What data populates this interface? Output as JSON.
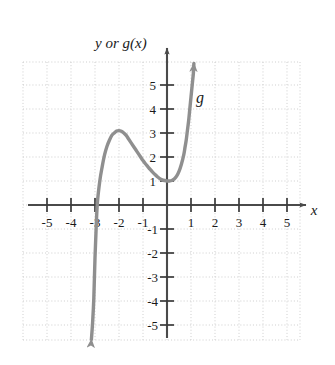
{
  "figure": {
    "y_axis_label": "y or g(x)",
    "x_axis_label": "x",
    "curve_label": "g"
  },
  "chart_data": {
    "type": "line",
    "title": "",
    "xlabel": "x",
    "ylabel": "y or g(x)",
    "xlim": [
      -5.9,
      5.6
    ],
    "ylim": [
      -5.9,
      6.0
    ],
    "grid": true,
    "legend": false,
    "x_ticks": [
      -5,
      -4,
      -3,
      -2,
      -1,
      1,
      2,
      3,
      4,
      5
    ],
    "y_ticks": [
      -5,
      -4,
      -3,
      -2,
      -1,
      1,
      2,
      3,
      4,
      5
    ],
    "x_tick_labels": [
      "-5",
      "-4",
      "-3",
      "-2",
      "-1",
      "1",
      "2",
      "3",
      "4",
      "5"
    ],
    "y_tick_labels": [
      "-5",
      "-4",
      "-3",
      "-2",
      "-1",
      "1",
      "2",
      "3",
      "4",
      "5"
    ],
    "series": [
      {
        "name": "g",
        "color": "#8f8f8f",
        "arrow_start": true,
        "arrow_end": true,
        "annotations": [
          {
            "text": "g",
            "x": 1.0,
            "y": 4.3
          }
        ],
        "features": {
          "local_maximum": [
            -2.0,
            3.1
          ],
          "local_minimum": [
            0.15,
            1.0
          ],
          "x_intercept": [
            -2.95,
            0
          ],
          "y_intercept": [
            0,
            1.05
          ]
        },
        "points": [
          [
            -3.15,
            -5.6
          ],
          [
            -3.1,
            -4.9
          ],
          [
            -3.05,
            -3.9
          ],
          [
            -3.0,
            -2.2
          ],
          [
            -2.95,
            -0.9
          ],
          [
            -2.9,
            0.1
          ],
          [
            -2.8,
            1.0
          ],
          [
            -2.7,
            1.6
          ],
          [
            -2.6,
            2.1
          ],
          [
            -2.5,
            2.45
          ],
          [
            -2.4,
            2.7
          ],
          [
            -2.3,
            2.9
          ],
          [
            -2.2,
            3.0
          ],
          [
            -2.1,
            3.08
          ],
          [
            -2.0,
            3.1
          ],
          [
            -1.9,
            3.07
          ],
          [
            -1.8,
            3.0
          ],
          [
            -1.7,
            2.9
          ],
          [
            -1.6,
            2.75
          ],
          [
            -1.5,
            2.6
          ],
          [
            -1.4,
            2.45
          ],
          [
            -1.3,
            2.3
          ],
          [
            -1.2,
            2.15
          ],
          [
            -1.1,
            2.0
          ],
          [
            -1.0,
            1.85
          ],
          [
            -0.9,
            1.72
          ],
          [
            -0.8,
            1.6
          ],
          [
            -0.7,
            1.48
          ],
          [
            -0.6,
            1.37
          ],
          [
            -0.5,
            1.27
          ],
          [
            -0.4,
            1.18
          ],
          [
            -0.3,
            1.1
          ],
          [
            -0.2,
            1.05
          ],
          [
            -0.1,
            1.02
          ],
          [
            0.0,
            1.0
          ],
          [
            0.1,
            1.0
          ],
          [
            0.2,
            1.02
          ],
          [
            0.3,
            1.08
          ],
          [
            0.4,
            1.2
          ],
          [
            0.5,
            1.4
          ],
          [
            0.6,
            1.7
          ],
          [
            0.7,
            2.1
          ],
          [
            0.75,
            2.4
          ],
          [
            0.8,
            2.7
          ],
          [
            0.85,
            3.1
          ],
          [
            0.9,
            3.5
          ],
          [
            0.95,
            4.0
          ],
          [
            1.0,
            4.5
          ],
          [
            1.05,
            5.0
          ],
          [
            1.1,
            5.5
          ],
          [
            1.12,
            5.9
          ]
        ]
      }
    ]
  }
}
